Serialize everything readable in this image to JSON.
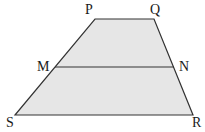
{
  "diagram": {
    "type": "trapezoid-with-midsegment",
    "fill_color": "#e6e6e6",
    "stroke_color": "#333333",
    "vertices": {
      "P": {
        "label": "P",
        "x": 95,
        "y": 19
      },
      "Q": {
        "label": "Q",
        "x": 154,
        "y": 19
      },
      "M": {
        "label": "M",
        "x": 55,
        "y": 67
      },
      "N": {
        "label": "N",
        "x": 174,
        "y": 67
      },
      "S": {
        "label": "S",
        "x": 15,
        "y": 115
      },
      "R": {
        "label": "R",
        "x": 193,
        "y": 115
      }
    },
    "segments": [
      {
        "from": "P",
        "to": "Q"
      },
      {
        "from": "Q",
        "to": "R"
      },
      {
        "from": "R",
        "to": "S"
      },
      {
        "from": "S",
        "to": "P"
      },
      {
        "from": "M",
        "to": "N"
      }
    ],
    "labels": {
      "P": "P",
      "Q": "Q",
      "M": "M",
      "N": "N",
      "S": "S",
      "R": "R"
    }
  }
}
